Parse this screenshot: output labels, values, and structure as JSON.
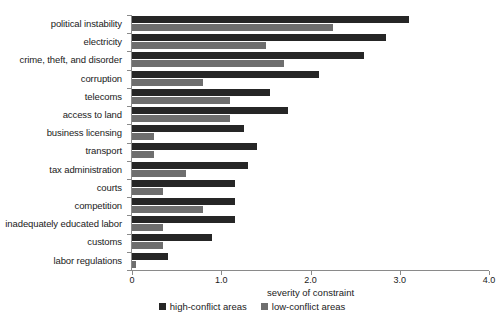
{
  "chart_data": {
    "type": "bar",
    "orientation": "horizontal",
    "title": "",
    "xlabel": "severity of constraint",
    "ylabel": "",
    "xlim": [
      0,
      4.0
    ],
    "xticks": [
      "0",
      "1.0",
      "2.0",
      "3.0",
      "4.0"
    ],
    "xtick_values": [
      0,
      1.0,
      2.0,
      3.0,
      4.0
    ],
    "grid": false,
    "legend_position": "bottom-center",
    "categories": [
      "political instability",
      "electricity",
      "crime, theft, and disorder",
      "corruption",
      "telecoms",
      "access to land",
      "business licensing",
      "transport",
      "tax administration",
      "courts",
      "competition",
      "inadequately educated labor",
      "customs",
      "labor regulations"
    ],
    "series": [
      {
        "name": "high-conflict areas",
        "color": "#262626",
        "values": [
          3.1,
          2.85,
          2.6,
          2.1,
          1.55,
          1.75,
          1.25,
          1.4,
          1.3,
          1.15,
          1.15,
          1.15,
          0.9,
          0.4
        ]
      },
      {
        "name": "low-conflict areas",
        "color": "#6e6e6e",
        "values": [
          2.25,
          1.5,
          1.7,
          0.8,
          1.1,
          1.1,
          0.25,
          0.25,
          0.6,
          0.35,
          0.8,
          0.35,
          0.35,
          0.05
        ]
      }
    ]
  }
}
